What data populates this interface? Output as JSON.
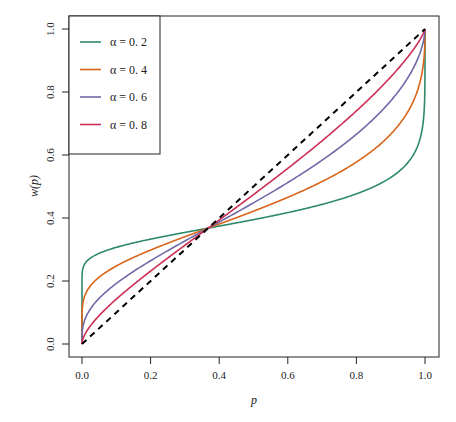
{
  "chart_data": {
    "type": "line",
    "title": "",
    "xlabel": "p",
    "ylabel": "w(p)",
    "xlim": [
      0,
      1
    ],
    "ylim": [
      0,
      1
    ],
    "x_ticks": [
      "0.0",
      "0.2",
      "0.4",
      "0.6",
      "0.8",
      "1.0"
    ],
    "y_ticks": [
      "0.0",
      "0.2",
      "0.4",
      "0.6",
      "0.8",
      "1.0"
    ],
    "grid": false,
    "legend_position": "top-left",
    "x": [
      0,
      0.01,
      0.05,
      0.1,
      0.2,
      0.3,
      0.368,
      0.5,
      0.6,
      0.7,
      0.8,
      0.9,
      0.95,
      0.99,
      1
    ],
    "series": [
      {
        "name": "α = 0. 2",
        "alpha": 0.2,
        "color": "#2e8a6a",
        "values": [
          0,
          0.257,
          0.292,
          0.311,
          0.335,
          0.354,
          0.368,
          0.39,
          0.406,
          0.425,
          0.451,
          0.495,
          0.541,
          0.66,
          1
        ]
      },
      {
        "name": "α = 0. 4",
        "alpha": 0.4,
        "color": "#d9651a",
        "values": [
          0,
          0.138,
          0.191,
          0.227,
          0.283,
          0.332,
          0.368,
          0.43,
          0.482,
          0.54,
          0.613,
          0.716,
          0.794,
          0.916,
          1
        ]
      },
      {
        "name": "α = 0. 6",
        "alpha": 0.6,
        "color": "#6f6aa8",
        "values": [
          0,
          0.064,
          0.12,
          0.162,
          0.234,
          0.311,
          0.368,
          0.47,
          0.549,
          0.633,
          0.726,
          0.839,
          0.903,
          0.975,
          1
        ]
      },
      {
        "name": "α = 0. 8",
        "alpha": 0.8,
        "color": "#cc2f55",
        "values": [
          0,
          0.029,
          0.074,
          0.118,
          0.202,
          0.29,
          0.368,
          0.509,
          0.601,
          0.698,
          0.801,
          0.903,
          0.953,
          0.991,
          1
        ]
      },
      {
        "name": "identity",
        "style": "dashed",
        "color": "#000000",
        "values": [
          0,
          0.01,
          0.05,
          0.1,
          0.2,
          0.3,
          0.368,
          0.5,
          0.6,
          0.7,
          0.8,
          0.9,
          0.95,
          0.99,
          1
        ]
      }
    ],
    "annotations": []
  },
  "legend": {
    "items": [
      {
        "label": "α = 0. 2",
        "color": "#2e8a6a"
      },
      {
        "label": "α = 0. 4",
        "color": "#d9651a"
      },
      {
        "label": "α = 0. 6",
        "color": "#6f6aa8"
      },
      {
        "label": "α = 0. 8",
        "color": "#cc2f55"
      }
    ]
  },
  "axes": {
    "xlabel": "p",
    "ylabel": "w(p)",
    "x_ticks": [
      "0.0",
      "0.2",
      "0.4",
      "0.6",
      "0.8",
      "1.0"
    ],
    "y_ticks": [
      "0.0",
      "0.2",
      "0.4",
      "0.6",
      "0.8",
      "1.0"
    ]
  }
}
